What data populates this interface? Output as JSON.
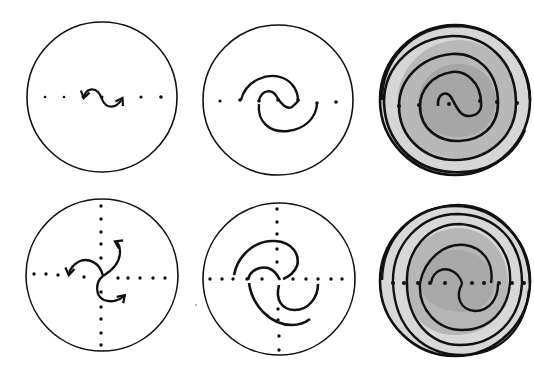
{
  "figure": {
    "colors": {
      "stroke": "#111111",
      "background": "#ffffff",
      "shade_outer": "#d8d8d8",
      "shade_mid": "#b4b4b4",
      "shade_inner": "#a4a4a4"
    },
    "panels": [
      {
        "id": "top-left",
        "row": 1,
        "col": 1,
        "axes": "horizontal",
        "content": "small two-armed S-curve with arrowheads on dotted line"
      },
      {
        "id": "top-middle",
        "row": 1,
        "col": 2,
        "axes": "horizontal",
        "content": "two-armed spiral arcs crossing dotted line"
      },
      {
        "id": "top-right",
        "row": 1,
        "col": 3,
        "axes": "horizontal",
        "content": "fully developed two-armed shaded spiral"
      },
      {
        "id": "bottom-left",
        "row": 2,
        "col": 1,
        "axes": "horizontal+vertical",
        "content": "small three-armed curve with arrowheads on dotted cross"
      },
      {
        "id": "bottom-middle",
        "row": 2,
        "col": 2,
        "axes": "horizontal+vertical",
        "content": "three-armed spiral arcs on dotted cross"
      },
      {
        "id": "bottom-right",
        "row": 2,
        "col": 3,
        "axes": "horizontal",
        "content": "fully developed multi-armed shaded spiral"
      }
    ]
  }
}
